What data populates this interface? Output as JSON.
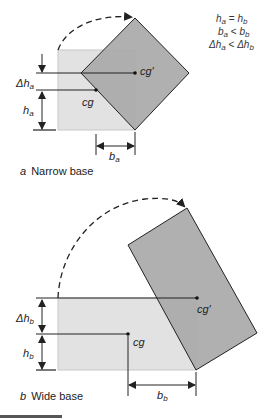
{
  "colors": {
    "light_fill": "#e2e2e2",
    "light_edge": "#c8c8c8",
    "dark_fill": "#a9a9a9",
    "line": "#222222",
    "footer_bar": "#555555"
  },
  "relations": [
    {
      "lhs": "h",
      "lhs_sub": "a",
      "op": " = ",
      "rhs": "h",
      "rhs_sub": "b"
    },
    {
      "lhs": "b",
      "lhs_sub": "a",
      "op": " < ",
      "rhs": "b",
      "rhs_sub": "b"
    },
    {
      "lhs": "Δh",
      "lhs_sub": "a",
      "op": " <  ",
      "rhs": "Δh",
      "rhs_sub": "b"
    }
  ],
  "panel_a": {
    "caption_letter": "a",
    "caption_text": "Narrow base",
    "cg_label": "cg",
    "cg_prime_label": "cg'",
    "delta_h": {
      "main": "Δh",
      "sub": "a"
    },
    "h": {
      "main": "h",
      "sub": "a"
    },
    "b": {
      "main": "b",
      "sub": "a"
    }
  },
  "panel_b": {
    "caption_letter": "b",
    "caption_text": "Wide base",
    "cg_label": "cg",
    "cg_prime_label": "cg'",
    "delta_h": {
      "main": "Δh",
      "sub": "b"
    },
    "h": {
      "main": "h",
      "sub": "b"
    },
    "b": {
      "main": "b",
      "sub": "b"
    }
  }
}
